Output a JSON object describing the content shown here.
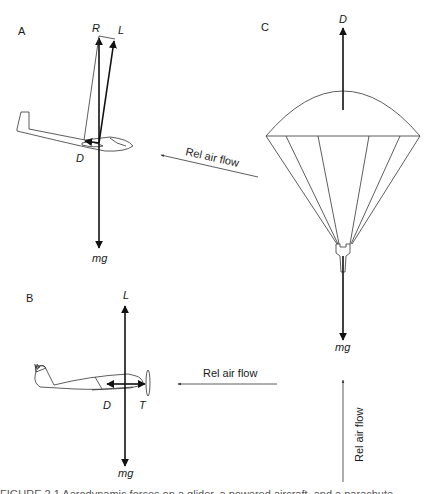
{
  "panels": {
    "A": {
      "label": "A",
      "subject": "glider",
      "forces": {
        "resultant": "R",
        "lift": "L",
        "drag": "D",
        "weight": "mg"
      },
      "airflow_label": "Rel air flow"
    },
    "B": {
      "label": "B",
      "subject": "powered aircraft",
      "forces": {
        "lift": "L",
        "drag": "D",
        "thrust": "T",
        "weight": "mg"
      },
      "airflow_label": "Rel air flow"
    },
    "C": {
      "label": "C",
      "subject": "parachute",
      "forces": {
        "drag": "D",
        "weight": "mg"
      },
      "airflow_label": "Rel air flow"
    }
  },
  "caption": {
    "text": "FIGURE 2.1  Aerodynamic forces on a glider, a powered aircraft, and a parachute"
  },
  "colors": {
    "line": "#111111",
    "thin_line": "#333333",
    "background": "#ffffff"
  }
}
